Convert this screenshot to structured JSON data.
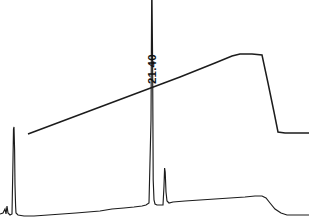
{
  "figure": {
    "kind": "chromatogram",
    "background_color": "#ffffff",
    "trace_color": "#1c1c1c",
    "width": 309,
    "height": 222
  },
  "annotations": [
    {
      "name": "retention-time-label",
      "text": "21.40",
      "orientation": "vertical",
      "x": 147,
      "y": 84
    }
  ],
  "chart_data": {
    "type": "line",
    "title": "",
    "xlabel": "",
    "ylabel": "",
    "xlim": [
      0,
      309
    ],
    "ylim": [
      222,
      0
    ],
    "grid": false,
    "legend": null,
    "axes_visible": false,
    "annotations": [
      "21.40"
    ],
    "series": [
      {
        "name": "detector-signal",
        "color": "#1c1c1c",
        "description": "Detector response trace with solvent-front peak, clipped main analyte peak at 21.40 and a small trailing peak",
        "points": [
          [
            0,
            214
          ],
          [
            3,
            213
          ],
          [
            5,
            209
          ],
          [
            6,
            214
          ],
          [
            7,
            206
          ],
          [
            8,
            213
          ],
          [
            10,
            215
          ],
          [
            12,
            214
          ],
          [
            13,
            160
          ],
          [
            13.5,
            129
          ],
          [
            14,
            127
          ],
          [
            14.6,
            150
          ],
          [
            15,
            185
          ],
          [
            15.6,
            206
          ],
          [
            16,
            213
          ],
          [
            18,
            215
          ],
          [
            24,
            216
          ],
          [
            34,
            216
          ],
          [
            48,
            215
          ],
          [
            62,
            214
          ],
          [
            76,
            213
          ],
          [
            88,
            212
          ],
          [
            100,
            211
          ],
          [
            112,
            209
          ],
          [
            124,
            208
          ],
          [
            134,
            207
          ],
          [
            142,
            206
          ],
          [
            146,
            205
          ],
          [
            149,
            203
          ],
          [
            151,
            120
          ],
          [
            151.8,
            -30
          ],
          [
            152.6,
            60
          ],
          [
            153.2,
            180
          ],
          [
            154,
            200
          ],
          [
            155,
            204
          ],
          [
            157,
            205
          ],
          [
            160,
            205
          ],
          [
            163,
            205
          ],
          [
            164,
            186
          ],
          [
            164.6,
            168
          ],
          [
            165.2,
            172
          ],
          [
            166,
            192
          ],
          [
            167,
            201
          ],
          [
            169,
            203
          ],
          [
            173,
            202
          ],
          [
            185,
            201
          ],
          [
            200,
            200
          ],
          [
            215,
            199
          ],
          [
            230,
            198
          ],
          [
            245,
            197
          ],
          [
            255,
            196
          ],
          [
            262,
            196
          ],
          [
            266,
            198
          ],
          [
            270,
            203
          ],
          [
            275,
            209
          ],
          [
            281,
            213
          ],
          [
            287,
            215
          ],
          [
            295,
            215
          ],
          [
            309,
            215
          ]
        ]
      },
      {
        "name": "gradient-program",
        "color": "#1c1c1c",
        "description": "Overlaid solvent gradient / pressure trapezoid ramp, plateau and step down",
        "points": [
          [
            28,
            134
          ],
          [
            60,
            122
          ],
          [
            100,
            107
          ],
          [
            140,
            92
          ],
          [
            180,
            77
          ],
          [
            215,
            63
          ],
          [
            232,
            56
          ],
          [
            240,
            54
          ],
          [
            252,
            54
          ],
          [
            262,
            55
          ],
          [
            268,
            83
          ],
          [
            274,
            112
          ],
          [
            278,
            132
          ],
          [
            285,
            133
          ],
          [
            300,
            133
          ],
          [
            309,
            133
          ]
        ]
      }
    ]
  }
}
